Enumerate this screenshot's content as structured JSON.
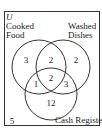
{
  "universe_label": "U",
  "sets": {
    "a": {
      "line1": "Cooked",
      "line2": "Food"
    },
    "b": {
      "line1": "Washed",
      "line2": "Dishes"
    },
    "c": {
      "label": "Cash Register"
    }
  },
  "regions": {
    "a_only": "3",
    "ab_only": "2",
    "b_only": "2",
    "ac_only": "1",
    "abc": "2",
    "bc_only": "3",
    "c_only": "12",
    "outside": "5"
  }
}
